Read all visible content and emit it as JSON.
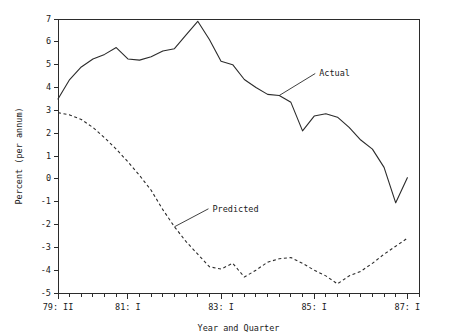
{
  "chart_data": {
    "type": "line",
    "title": "",
    "subtitle": "",
    "xlabel": "Year and Quarter",
    "ylabel": "Percent (per annum)",
    "ylim": [
      -5,
      7
    ],
    "ytick_labels": [
      "7",
      "6",
      "5",
      "4",
      "3",
      "2",
      "1",
      "0",
      "-1",
      "-2",
      "-3",
      "-4",
      "-5"
    ],
    "ytick_values": [
      7,
      6,
      5,
      4,
      3,
      2,
      1,
      0,
      -1,
      -2,
      -3,
      -4,
      -5
    ],
    "grid": false,
    "legend_position": "inline-annotations",
    "x_major_tick_labels": [
      "79: II",
      "81: I",
      "83: I",
      "85: I",
      "87: I"
    ],
    "x_major_tick_indices": [
      0,
      6,
      14,
      22,
      30
    ],
    "x": [
      "79: II",
      "79: III",
      "79: IV",
      "80: I",
      "80: II",
      "80: III",
      "81: I",
      "81: II",
      "81: III",
      "81: IV",
      "82: I",
      "82: II",
      "82: III",
      "82: IV",
      "83: I",
      "83: II",
      "83: III",
      "83: IV",
      "84: I",
      "84: II",
      "84: III",
      "84: IV",
      "85: I",
      "85: II",
      "85: III",
      "85: IV",
      "86: I",
      "86: II",
      "86: III",
      "86: IV",
      "87: I",
      "87: II"
    ],
    "series": [
      {
        "name": "Actual",
        "style": "solid",
        "values": [
          3.5,
          4.35,
          4.9,
          5.25,
          5.45,
          5.75,
          5.25,
          5.2,
          5.35,
          5.6,
          5.7,
          6.3,
          6.9,
          6.1,
          5.15,
          5.0,
          4.35,
          4.0,
          3.7,
          3.65,
          3.35,
          2.1,
          2.75,
          2.85,
          2.7,
          2.25,
          1.7,
          1.3,
          0.5,
          -1.05,
          0.05,
          null
        ]
      },
      {
        "name": "Predicted",
        "style": "dashed",
        "values": [
          2.9,
          2.8,
          2.6,
          2.25,
          1.8,
          1.3,
          0.75,
          0.15,
          -0.5,
          -1.35,
          -2.1,
          -2.75,
          -3.3,
          -3.85,
          -3.95,
          -3.7,
          -4.3,
          -4.0,
          -3.65,
          -3.5,
          -3.45,
          -3.7,
          -4.0,
          -4.25,
          -4.6,
          -4.25,
          -4.05,
          -3.7,
          -3.3,
          -2.95,
          -2.6,
          null
        ]
      }
    ],
    "annotations": [
      {
        "label": "Actual",
        "anchor_x": "84: II",
        "anchor_y": 3.65
      },
      {
        "label": "Predicted",
        "anchor_x": "82: I",
        "anchor_y": -2.1
      }
    ]
  }
}
